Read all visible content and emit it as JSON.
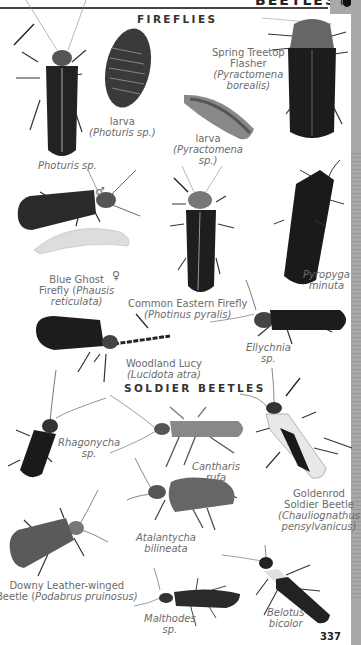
{
  "header": {
    "title": "BEETLES",
    "page_number": "337"
  },
  "sections": [
    {
      "title": "FIREFLIES"
    },
    {
      "title": "SOLDIER BEETLES"
    }
  ],
  "fireflies": [
    {
      "id": "photuris",
      "common": "",
      "scientific": "Photuris sp.",
      "has_arrow": true
    },
    {
      "id": "photuris-larva",
      "common": "larva",
      "scientific": "(Photuris sp.)"
    },
    {
      "id": "spring-treetop-flasher",
      "common_line1": "Spring Treetop",
      "common_line2": "Flasher",
      "scientific_line1": "(Pyractomena",
      "scientific_line2": "borealis)"
    },
    {
      "id": "pyractomena-larva",
      "common": "larva",
      "scientific_line1": "(Pyractomena",
      "scientific_line2": "sp.)"
    },
    {
      "id": "blue-ghost",
      "common_line1": "Blue Ghost",
      "common_line2": "Firefly (",
      "scientific_line1": "Phausis",
      "scientific_line2": "reticulata)",
      "male_symbol": "♂",
      "female_symbol": "♀"
    },
    {
      "id": "common-eastern",
      "common": "Common Eastern Firefly",
      "scientific": "(Photinus pyralis)",
      "has_arrow": true
    },
    {
      "id": "pyropyga",
      "scientific_line1": "Pyropyga",
      "scientific_line2": "minuta"
    },
    {
      "id": "woodland-lucy",
      "common": "Woodland Lucy",
      "scientific": "(Lucidota atra)",
      "has_arrow": true
    },
    {
      "id": "ellychnia",
      "scientific_line1": "Ellychnia",
      "scientific_line2": "sp."
    }
  ],
  "soldier_beetles": [
    {
      "id": "rhagonycha",
      "scientific_line1": "Rhagonycha",
      "scientific_line2": "sp."
    },
    {
      "id": "cantharis",
      "scientific_line1": "Cantharis",
      "scientific_line2": "rufa"
    },
    {
      "id": "goldenrod",
      "common_line1": "Goldenrod",
      "common_line2": "Soldier Beetle",
      "scientific_line1": "(Chauliognathus",
      "scientific_line2": "pensylvanicus)",
      "has_arrow": true
    },
    {
      "id": "atalantycha",
      "scientific_line1": "Atalantycha",
      "scientific_line2": "bilineata"
    },
    {
      "id": "downy",
      "common_line1": "Downy Leather-winged",
      "common_line2": "Beetle (",
      "scientific": "Podabrus pruinosus)"
    },
    {
      "id": "malthodes",
      "scientific_line1": "Malthodes",
      "scientific_line2": "sp."
    },
    {
      "id": "belotus",
      "scientific_line1": "Belotus",
      "scientific_line2": "bicolor"
    }
  ],
  "colors": {
    "tab": "#a9a9a9",
    "label_text": "#6b6b6b",
    "heading": "#333333",
    "rule": "#444444"
  }
}
